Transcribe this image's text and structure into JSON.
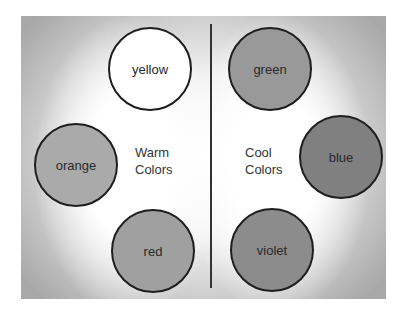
{
  "diagram": {
    "warm": {
      "label_line1": "Warm",
      "label_line2": "Colors",
      "circles": [
        {
          "name": "yellow",
          "fill": "#ffffff"
        },
        {
          "name": "orange",
          "fill": "#aaaaaa"
        },
        {
          "name": "red",
          "fill": "#a0a0a0"
        }
      ]
    },
    "cool": {
      "label_line1": "Cool",
      "label_line2": "Colors",
      "circles": [
        {
          "name": "green",
          "fill": "#999999"
        },
        {
          "name": "blue",
          "fill": "#808080"
        },
        {
          "name": "violet",
          "fill": "#8c8c8c"
        }
      ]
    }
  }
}
